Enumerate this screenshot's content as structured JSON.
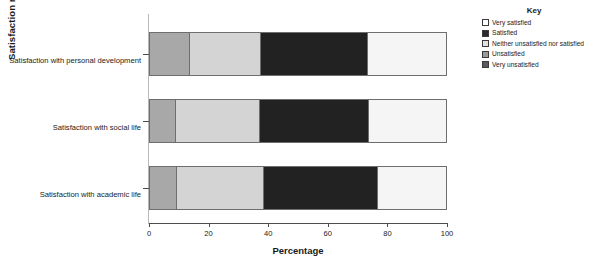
{
  "chart_data": {
    "type": "bar",
    "orientation": "horizontal",
    "stacked": true,
    "title": "",
    "xlabel": "Percentage",
    "ylabel": "Satisfaction ratings",
    "xlim": [
      0,
      100
    ],
    "xticks": [
      0,
      20,
      40,
      60,
      80,
      100
    ],
    "grid": false,
    "legend_title": "Key",
    "legend_position": "top-right",
    "categories": [
      "Satisfaction with personal development",
      "Satisfaction with social life",
      "Satisfaction with academic life"
    ],
    "series": [
      {
        "name": "Very satisfied",
        "color": "#ffffff",
        "values": [
          0,
          0,
          0
        ]
      },
      {
        "name": "Satisfied",
        "color": "#a8a8a8",
        "values": [
          13.5,
          8.7,
          9.0
        ]
      },
      {
        "name": "Neither unsatisfied nor satisfied",
        "color": "#d4d4d4",
        "values": [
          24.0,
          28.3,
          29.5
        ]
      },
      {
        "name": "Unsatisfied",
        "color": "#222222",
        "values": [
          36.0,
          37.0,
          38.5
        ]
      },
      {
        "name": "Very unsatisfied",
        "color": "#f5f5f5",
        "values": [
          26.5,
          26.0,
          23.0
        ]
      }
    ]
  },
  "legend": {
    "title": "Key",
    "items": [
      {
        "label": "Very satisfied",
        "color": "#ffffff"
      },
      {
        "label": "Satisfied",
        "color": "#2b2b2b"
      },
      {
        "label": "Neither unsatisfied nor satisfied",
        "color": "#e2e2e2"
      },
      {
        "label": "Unsatisfied",
        "color": "#9a9a9a"
      },
      {
        "label": "Very unsatisfied",
        "color": "#5a5a5a"
      }
    ]
  },
  "axes": {
    "x_title": "Percentage",
    "y_title": "Satisfaction ratings",
    "x_tick_labels": [
      "0",
      "20",
      "40",
      "60",
      "80",
      "100"
    ],
    "y_tick_labels": [
      "Satisfaction with personal development",
      "Satisfaction with social life",
      "Satisfaction with academic life"
    ]
  }
}
